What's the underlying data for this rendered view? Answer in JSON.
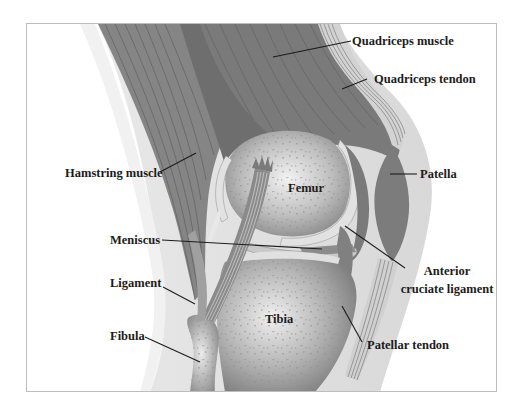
{
  "diagram": {
    "colors": {
      "muscle": "#7e7e7e",
      "muscle_dark": "#6a6a6a",
      "tendon": "#d9d9d9",
      "bone_light": "#eeeeee",
      "bone_dark": "#8c8c8c",
      "skin": "#e6e6e6",
      "leader_line": "#1c1c1c",
      "frame": "#bdbdbd"
    },
    "labels": {
      "quadriceps_muscle": "Quadriceps muscle",
      "quadriceps_tendon": "Quadriceps tendon",
      "hamstring_muscle": "Hamstring muscle",
      "patella": "Patella",
      "femur": "Femur",
      "meniscus": "Meniscus",
      "anterior_line1": "Anterior",
      "anterior_line2": "cruciate ligament",
      "ligament": "Ligament",
      "tibia": "Tibia",
      "fibula": "Fibula",
      "patellar_tendon": "Patellar tendon"
    }
  }
}
